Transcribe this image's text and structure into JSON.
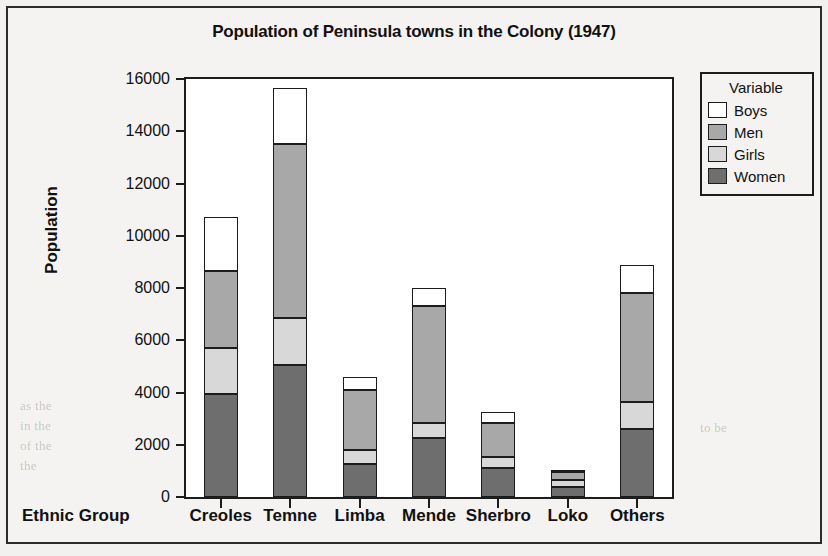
{
  "figure": {
    "title": "Population of Peninsula towns in the Colony (1947)",
    "xlabel": "Ethnic Group",
    "ylabel": "Population"
  },
  "legend": {
    "title": "Variable",
    "entries": [
      {
        "label": "Boys",
        "color": "#ffffff"
      },
      {
        "label": "Men",
        "color": "#a8a8a8"
      },
      {
        "label": "Girls",
        "color": "#d8d8d8"
      },
      {
        "label": "Women",
        "color": "#6e6e6e"
      }
    ]
  },
  "ghost_text": [
    {
      "text": "to be",
      "x": 700,
      "y": 420
    },
    {
      "text": "as the",
      "x": 20,
      "y": 398
    },
    {
      "text": "in the",
      "x": 20,
      "y": 418
    },
    {
      "text": "of the",
      "x": 20,
      "y": 438
    },
    {
      "text": "the",
      "x": 20,
      "y": 458
    }
  ],
  "chart_data": {
    "type": "bar",
    "subtype": "stacked",
    "title": "Population of Peninsula towns in the Colony (1947)",
    "xlabel": "Ethnic Group",
    "ylabel": "Population",
    "ylim": [
      0,
      16000
    ],
    "yticks": [
      0,
      2000,
      4000,
      6000,
      8000,
      10000,
      12000,
      14000,
      16000
    ],
    "grid": false,
    "legend_position": "right",
    "legend_title": "Variable",
    "stack_order_bottom_to_top": [
      "Women",
      "Girls",
      "Men",
      "Boys"
    ],
    "categories": [
      "Creoles",
      "Temne",
      "Limba",
      "Mende",
      "Sherbro",
      "Loko",
      "Others"
    ],
    "series": [
      {
        "name": "Women",
        "color": "#6e6e6e",
        "values": [
          3950,
          5050,
          1250,
          2250,
          1100,
          400,
          2600
        ]
      },
      {
        "name": "Girls",
        "color": "#d8d8d8",
        "values": [
          1750,
          1800,
          550,
          600,
          450,
          250,
          1050
        ]
      },
      {
        "name": "Men",
        "color": "#a8a8a8",
        "values": [
          2950,
          6650,
          2300,
          4450,
          1300,
          300,
          4150
        ]
      },
      {
        "name": "Boys",
        "color": "#ffffff",
        "values": [
          2050,
          2150,
          500,
          700,
          400,
          100,
          1100
        ]
      }
    ],
    "totals": [
      10700,
      15650,
      4600,
      8000,
      3250,
      1050,
      8900
    ]
  }
}
